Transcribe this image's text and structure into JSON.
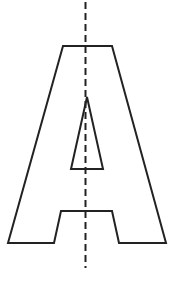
{
  "figure": {
    "letter": "A",
    "stroke_color": "#222222",
    "background": "#ffffff",
    "outer_outline": [
      [
        63,
        46
      ],
      [
        112,
        46
      ],
      [
        166,
        243
      ],
      [
        119,
        243
      ],
      [
        112,
        211
      ],
      [
        61,
        211
      ],
      [
        54,
        243
      ],
      [
        8,
        243
      ]
    ],
    "inner_triangle": [
      [
        87,
        97
      ],
      [
        103,
        169
      ],
      [
        71,
        169
      ]
    ],
    "symmetry_line": {
      "x": 85.5,
      "y1": 2,
      "y2": 268,
      "style": "dashed"
    }
  }
}
